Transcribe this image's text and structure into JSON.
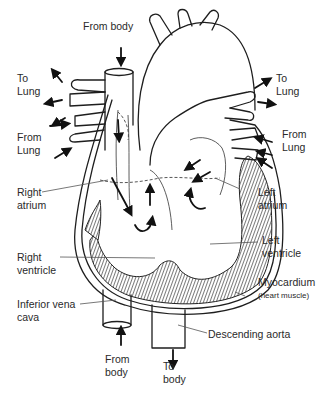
{
  "diagram": {
    "labels": {
      "from_body_top": "From body",
      "to_lung_left_1": "To",
      "to_lung_left_2": "Lung",
      "from_lung_left_1": "From",
      "from_lung_left_2": "Lung",
      "right_atrium_1": "Right",
      "right_atrium_2": "atrium",
      "right_ventricle_1": "Right",
      "right_ventricle_2": "ventricle",
      "inferior_vena_cava_1": "Inferior vena",
      "inferior_vena_cava_2": "cava",
      "from_body_bottom_1": "From",
      "from_body_bottom_2": "body",
      "to_body_bottom_1": "To",
      "to_body_bottom_2": "body",
      "to_lung_right_1": "To",
      "to_lung_right_2": "Lung",
      "from_lung_right_1": "From",
      "from_lung_right_2": "Lung",
      "left_atrium_1": "Left",
      "left_atrium_2": "atrium",
      "left_ventricle_1": "Left",
      "left_ventricle_2": "ventricle",
      "myocardium": "Myocardium",
      "myocardium_note": "(heart muscle)",
      "descending_aorta": "Descending aorta"
    },
    "colors": {
      "line": "#1e1e1e",
      "text": "#2a2a2a",
      "background": "#ffffff"
    }
  }
}
